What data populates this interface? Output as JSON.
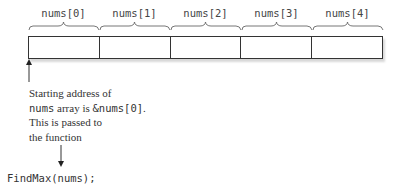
{
  "array": {
    "name": "nums",
    "labels": [
      "nums[0]",
      "nums[1]",
      "nums[2]",
      "nums[3]",
      "nums[4]"
    ],
    "cell_count": 5
  },
  "annotation": {
    "line1": "Starting address of",
    "line2_code": "nums",
    "line2_text": " array is ",
    "line2_code2": "&nums[0]",
    "line2_end": ".",
    "line3": "This is passed to",
    "line4": "the function"
  },
  "call": {
    "code": "FindMax(nums);"
  }
}
